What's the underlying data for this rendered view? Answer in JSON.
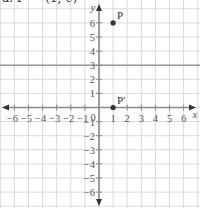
{
  "header": {
    "text": "a. P′ = (1, 0)"
  },
  "diagram": {
    "type": "coordinate-grid",
    "x_range": [
      -6,
      6
    ],
    "y_range": [
      -6,
      6
    ],
    "x_axis_label": "x",
    "y_axis_label": "y",
    "x_tick_labels": [
      "-6",
      "-5",
      "-4",
      "-3",
      "-2",
      "-1",
      "0",
      "1",
      "2",
      "3",
      "4",
      "5",
      "6"
    ],
    "y_tick_labels": [
      "6",
      "5",
      "4",
      "3",
      "2",
      "1",
      "-1",
      "-2",
      "-3",
      "-4",
      "-5",
      "-6"
    ],
    "mirror_line": {
      "equation": "y = 3",
      "y": 3
    },
    "points": [
      {
        "label": "P",
        "x": 1,
        "y": 6
      },
      {
        "label": "P′",
        "x": 1,
        "y": 0
      }
    ],
    "colors": {
      "grid": "#d9d9d9",
      "axis": "#8a8a8a",
      "mirror_line": "#9a9a9a",
      "point": "#333333"
    }
  }
}
